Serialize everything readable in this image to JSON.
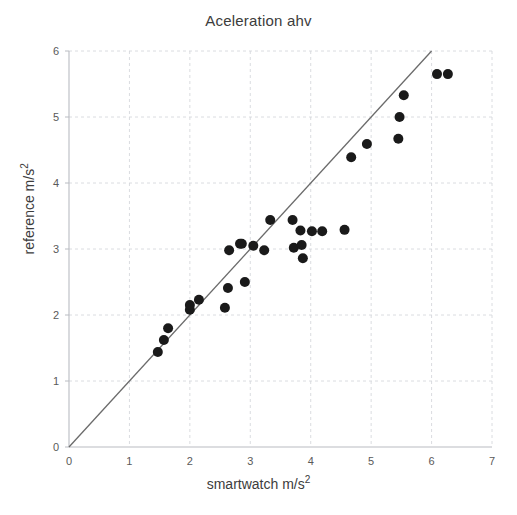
{
  "chart_data": {
    "type": "scatter",
    "title": "Aceleration ahv",
    "xlabel": "smartwatch m/s2",
    "ylabel": "reference m/s2",
    "xlim": [
      0,
      7
    ],
    "ylim": [
      0,
      6
    ],
    "xticks": [
      0,
      1,
      2,
      3,
      4,
      5,
      6,
      7
    ],
    "yticks": [
      0,
      1,
      2,
      3,
      4,
      5,
      6
    ],
    "grid": true,
    "legend": "none",
    "marker_color": "#1a1a1a",
    "marker_size": 5,
    "identity_line": {
      "label": "y = x reference line",
      "color": "#6b6b6b",
      "from": [
        0,
        0
      ],
      "to": [
        6.0,
        6.0
      ]
    },
    "series": [
      {
        "name": "measurements",
        "points": [
          [
            1.47,
            1.44
          ],
          [
            1.57,
            1.62
          ],
          [
            1.64,
            1.8
          ],
          [
            2.0,
            2.08
          ],
          [
            2.0,
            2.15
          ],
          [
            2.15,
            2.23
          ],
          [
            2.58,
            2.11
          ],
          [
            2.63,
            2.41
          ],
          [
            2.65,
            2.98
          ],
          [
            2.83,
            3.08
          ],
          [
            2.86,
            3.08
          ],
          [
            2.91,
            2.5
          ],
          [
            3.05,
            3.05
          ],
          [
            3.23,
            2.98
          ],
          [
            3.33,
            3.44
          ],
          [
            3.7,
            3.44
          ],
          [
            3.72,
            3.02
          ],
          [
            3.83,
            3.28
          ],
          [
            3.85,
            3.06
          ],
          [
            3.87,
            2.86
          ],
          [
            4.02,
            3.27
          ],
          [
            4.19,
            3.27
          ],
          [
            4.56,
            3.29
          ],
          [
            4.67,
            4.39
          ],
          [
            4.93,
            4.59
          ],
          [
            5.45,
            4.67
          ],
          [
            5.47,
            5.0
          ],
          [
            5.54,
            5.33
          ],
          [
            6.09,
            5.65
          ],
          [
            6.27,
            5.65
          ]
        ]
      }
    ]
  }
}
